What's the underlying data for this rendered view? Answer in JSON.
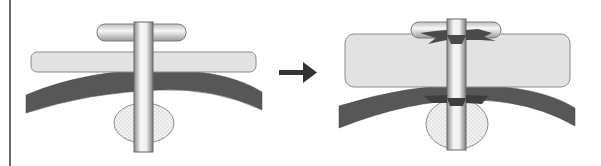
{
  "diagram": {
    "type": "before-after illustration",
    "panels": [
      {
        "id": "before",
        "elements": [
          "t-handle",
          "plate (thin)",
          "curved layer",
          "stippled oval",
          "vertical rod"
        ]
      },
      {
        "id": "after",
        "elements": [
          "t-handle",
          "plate (thick, swollen)",
          "curved layer",
          "stippled oval",
          "vertical rod",
          "tear marks at handle",
          "tear marks at layer"
        ]
      }
    ],
    "transition": "arrow-right-icon",
    "colors": {
      "plate_fill": "#e2e2e2",
      "layer_fill": "#5a5a5a",
      "rod_light": "#f4f4f4",
      "rod_shade": "#8a8a8a",
      "oval_fill": "#ececec",
      "outline": "#777777",
      "arrow": "#333333",
      "tear": "#4a4a4a"
    }
  }
}
